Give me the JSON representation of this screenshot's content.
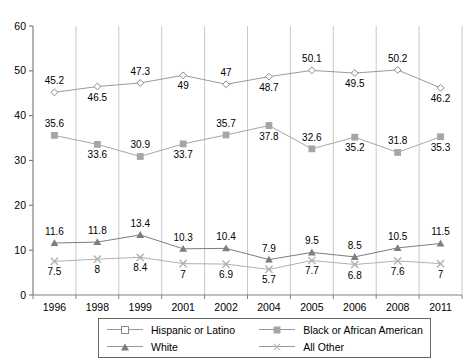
{
  "chart_data": {
    "type": "line",
    "title": "",
    "xlabel": "",
    "ylabel": "",
    "ylim": [
      0,
      60
    ],
    "yticks": [
      0,
      10,
      20,
      30,
      40,
      50,
      60
    ],
    "grid": "vertical-category-separators",
    "legend_position": "bottom-center",
    "categories": [
      "1996",
      "1998",
      "1999",
      "2001",
      "2002",
      "2004",
      "2005",
      "2006",
      "2008",
      "2011"
    ],
    "series": [
      {
        "name": "Hispanic or Latino",
        "marker": "diamond-open",
        "color": "#9a9a9a",
        "values": [
          45.2,
          46.5,
          47.3,
          49,
          47,
          48.7,
          50.1,
          49.5,
          50.2,
          46.2
        ],
        "labels": [
          "45.2",
          "46.5",
          "47.3",
          "49",
          "47",
          "48.7",
          "50.1",
          "49.5",
          "50.2",
          "46.2"
        ],
        "label_pos": [
          "above",
          "below",
          "above",
          "below",
          "above",
          "below",
          "above",
          "below",
          "above",
          "below"
        ]
      },
      {
        "name": "Black or African American",
        "marker": "square-filled",
        "color": "#a6a6a6",
        "values": [
          35.6,
          33.6,
          30.9,
          33.7,
          35.7,
          37.8,
          32.6,
          35.2,
          31.8,
          35.3
        ],
        "labels": [
          "35.6",
          "33.6",
          "30.9",
          "33.7",
          "35.7",
          "37.8",
          "32.6",
          "35.2",
          "31.8",
          "35.3"
        ],
        "label_pos": [
          "above",
          "below",
          "above",
          "below",
          "above",
          "below",
          "above",
          "below",
          "above",
          "below"
        ]
      },
      {
        "name": "White",
        "marker": "triangle-filled",
        "color": "#7d7d7d",
        "values": [
          11.6,
          11.8,
          13.4,
          10.3,
          10.4,
          7.9,
          9.5,
          8.5,
          10.5,
          11.5
        ],
        "labels": [
          "11.6",
          "11.8",
          "13.4",
          "10.3",
          "10.4",
          "7.9",
          "9.5",
          "8.5",
          "10.5",
          "11.5"
        ],
        "label_pos": [
          "above",
          "above",
          "above",
          "above",
          "above",
          "above",
          "above",
          "above",
          "above",
          "above"
        ]
      },
      {
        "name": "All Other",
        "marker": "x-cross",
        "color": "#b0b0b0",
        "values": [
          7.5,
          8,
          8.4,
          7,
          6.9,
          5.7,
          7.7,
          6.8,
          7.6,
          7
        ],
        "labels": [
          "7.5",
          "8",
          "8.4",
          "7",
          "6.9",
          "5.7",
          "7.7",
          "6.8",
          "7.6",
          "7"
        ],
        "label_pos": [
          "below",
          "below",
          "below",
          "below",
          "below",
          "below",
          "below",
          "below",
          "below",
          "below"
        ]
      }
    ]
  },
  "legend": {
    "items": [
      {
        "label": "Hispanic or Latino",
        "marker": "diamond-open"
      },
      {
        "label": "Black or African American",
        "marker": "square-filled"
      },
      {
        "label": "White",
        "marker": "triangle-filled"
      },
      {
        "label": "All Other",
        "marker": "x-cross"
      }
    ]
  },
  "axes": {
    "y_tick_labels": [
      "60",
      "50",
      "40",
      "30",
      "20",
      "10",
      "0"
    ],
    "x_tick_labels": [
      "1996",
      "1998",
      "1999",
      "2001",
      "2002",
      "2004",
      "2005",
      "2006",
      "2008",
      "2011"
    ]
  }
}
